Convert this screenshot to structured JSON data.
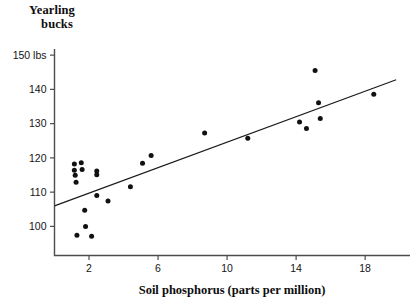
{
  "chart_data": {
    "type": "scatter",
    "title": "",
    "ylabel_lines": [
      "Yearling",
      "bucks"
    ],
    "xlabel": "Soil phosphorus (parts per million)",
    "y_unit_suffix": "lbs",
    "xlim": [
      0,
      20.6
    ],
    "ylim": [
      91.5,
      151.5
    ],
    "grid": false,
    "legend": "none",
    "yticks": [
      100,
      110,
      120,
      130,
      140,
      150
    ],
    "ytick_labels": [
      "100",
      "110",
      "120",
      "130",
      "140",
      "150 lbs"
    ],
    "xticks": [
      2,
      6,
      10,
      14,
      18
    ],
    "xtick_labels": [
      "2",
      "6",
      "10",
      "14",
      "18"
    ],
    "series": [
      {
        "name": "yearling buck weight vs soil phosphorus",
        "marker": "filled-circle",
        "points": [
          {
            "x": 1.15,
            "y": 118.2
          },
          {
            "x": 1.15,
            "y": 116.4
          },
          {
            "x": 1.2,
            "y": 114.9
          },
          {
            "x": 1.25,
            "y": 112.9
          },
          {
            "x": 1.3,
            "y": 97.4
          },
          {
            "x": 1.55,
            "y": 118.6
          },
          {
            "x": 1.6,
            "y": 116.6
          },
          {
            "x": 1.75,
            "y": 104.7
          },
          {
            "x": 1.8,
            "y": 100.0
          },
          {
            "x": 2.15,
            "y": 97.1
          },
          {
            "x": 2.45,
            "y": 109.0
          },
          {
            "x": 2.45,
            "y": 116.2
          },
          {
            "x": 2.45,
            "y": 115.1
          },
          {
            "x": 3.1,
            "y": 107.4
          },
          {
            "x": 5.1,
            "y": 118.4
          },
          {
            "x": 5.6,
            "y": 120.7
          },
          {
            "x": 4.4,
            "y": 111.6
          },
          {
            "x": 8.7,
            "y": 127.3
          },
          {
            "x": 11.2,
            "y": 125.7
          },
          {
            "x": 14.2,
            "y": 130.5
          },
          {
            "x": 15.3,
            "y": 136.1
          },
          {
            "x": 15.4,
            "y": 131.5
          },
          {
            "x": 15.1,
            "y": 145.5
          },
          {
            "x": 14.6,
            "y": 128.6
          },
          {
            "x": 18.5,
            "y": 138.6
          }
        ]
      }
    ],
    "fit_line": {
      "label": "least-squares regression line",
      "x0": 0.0,
      "y0": 106.0,
      "x1": 19.8,
      "y1": 142.8
    }
  }
}
